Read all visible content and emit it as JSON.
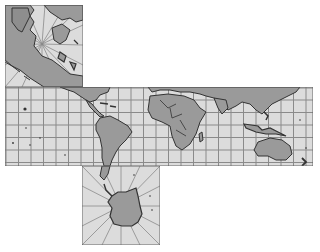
{
  "map": {
    "title": "World map in cube-face layout",
    "colors": {
      "background": "#ffffff",
      "ocean": "#dcdcdc",
      "land": "#9a9a9a",
      "coast": "#333333",
      "grid": "#8a8a8a"
    },
    "panels": [
      {
        "id": "arctic",
        "label": "North polar face",
        "x": 5,
        "y": 5,
        "width": 78,
        "height": 82
      },
      {
        "id": "equatorial",
        "label": "Equatorial band",
        "x": 5,
        "y": 87,
        "width": 308,
        "height": 79
      },
      {
        "id": "antarctic",
        "label": "South polar face",
        "x": 82,
        "y": 166,
        "width": 78,
        "height": 79
      }
    ],
    "grid": {
      "equatorial_spacing_px": 12.5
    },
    "regions": [
      "North America",
      "Greenland",
      "Arctic Ocean",
      "Europe",
      "Asia",
      "South America",
      "Africa",
      "Australia",
      "Indonesia",
      "Antarctica",
      "New Zealand"
    ]
  }
}
